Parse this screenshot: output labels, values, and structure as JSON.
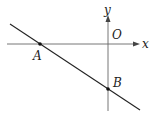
{
  "diagram": {
    "type": "coordinate-plane",
    "labels": {
      "x_axis": "x",
      "y_axis": "y",
      "origin": "O",
      "point_a": "A",
      "point_b": "B"
    },
    "colors": {
      "stroke": "#222222",
      "axis": "#555555"
    }
  }
}
